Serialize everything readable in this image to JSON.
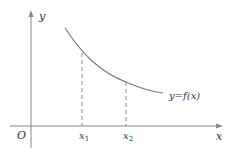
{
  "diagram": {
    "type": "function-graph",
    "axes": {
      "x_label": "x",
      "y_label": "y",
      "origin_label": "O"
    },
    "curve": {
      "label": "y=f(x)",
      "description": "decreasing convex curve"
    },
    "markers": [
      {
        "label": "x",
        "subscript": "1"
      },
      {
        "label": "x",
        "subscript": "2"
      }
    ],
    "colors": {
      "axes": "#888888",
      "curve": "#777777",
      "dashed": "#888888",
      "text": "#333333"
    }
  }
}
